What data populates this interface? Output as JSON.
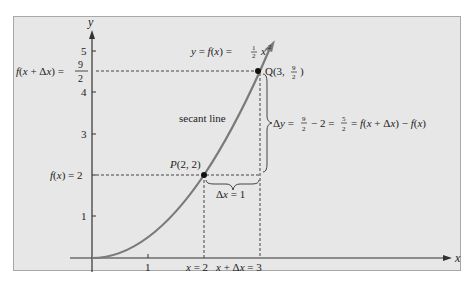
{
  "figure": {
    "axis_labels": {
      "x": "x",
      "y": "y"
    },
    "x_ticks": [
      {
        "value": 1,
        "label": "1"
      }
    ],
    "y_ticks": [
      {
        "value": 1,
        "label": "1"
      },
      {
        "value": 2,
        "label": ""
      },
      {
        "value": 3,
        "label": "3"
      },
      {
        "value": 4,
        "label": "4"
      },
      {
        "value": 5,
        "label": "5"
      }
    ],
    "curve_label": "y = f(x) = ½ x²",
    "curve_label_parts": {
      "lhs": "y = f(x) = ",
      "frac_num": "1",
      "frac_den": "2",
      "var": "x",
      "exp": "2"
    },
    "secant_label": "secant line",
    "point_p": {
      "label": "P(2, 2)",
      "x": 2,
      "y": 2
    },
    "point_q": {
      "label_prefix": "Q(3, ",
      "frac_num": "9",
      "frac_den": "2",
      "label_suffix": ")",
      "x": 3,
      "y": 4.5
    },
    "left_labels": {
      "fx_delta": "f(x + Δx) = ",
      "fx_delta_num": "9",
      "fx_delta_den": "2",
      "fx": "f(x) = 2"
    },
    "bottom_labels": {
      "x_eq_2": "x = 2",
      "x_plus_dx": "x + Δx = 3"
    },
    "delta_x_label": "Δx = 1",
    "delta_y_label": {
      "prefix": "Δy = ",
      "frac1_num": "9",
      "frac1_den": "2",
      "mid": " − 2 = ",
      "frac2_num": "5",
      "frac2_den": "2",
      "suffix": " = f(x + Δx) − f(x)"
    },
    "colors": {
      "curve": "#7a7a7a",
      "axis": "#333333",
      "dash": "#444444",
      "panel": "#e7e7e7"
    }
  }
}
